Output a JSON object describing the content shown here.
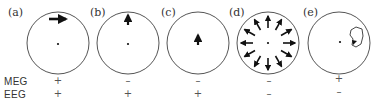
{
  "panels": [
    {
      "label": "(a)",
      "description": "tangential dipole near surface",
      "meg": "+",
      "eeg": "+"
    },
    {
      "label": "(b)",
      "description": "radial dipole near surface",
      "meg": "–",
      "eeg": "+"
    },
    {
      "label": "(c)",
      "description": "radial dipole deeper",
      "meg": "–",
      "eeg": "+"
    },
    {
      "label": "(d)",
      "description": "radially symmetric outward sources",
      "meg": "–",
      "eeg": "–"
    },
    {
      "label": "(e)",
      "description": "closed-field source",
      "meg": "+",
      "eeg": "–"
    }
  ],
  "rows": {
    "meg": "MEG",
    "eeg": "EEG"
  },
  "colors": {
    "outline": "#555555",
    "arrow": "#111111"
  }
}
